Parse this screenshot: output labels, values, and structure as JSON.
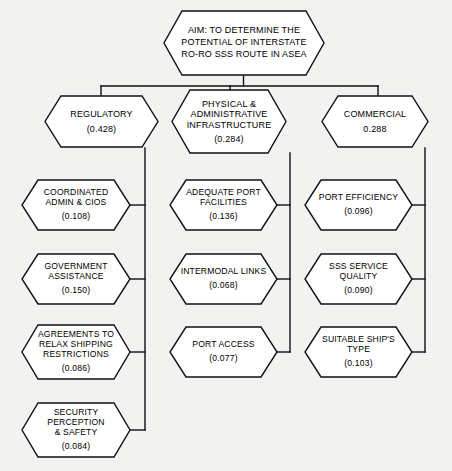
{
  "diagram": {
    "type": "hierarchy-tree",
    "orientation": "top-down",
    "node_shape": "hexagon",
    "colors": {
      "background": "#f2f2f0",
      "node_fill": "#ffffff",
      "stroke": "#111111",
      "text": "#000000"
    },
    "root": {
      "id": "aim",
      "label": "AIM: TO DETERMINE THE\nPOTENTIAL OF INTERSTATE\nRO-RO SSS ROUTE IN ASEA",
      "value": ""
    },
    "levels": [
      {
        "level": 1,
        "name": "criteria",
        "nodes": [
          {
            "id": "regulatory",
            "label": "REGULATORY",
            "value": "(0.428)"
          },
          {
            "id": "physical-admin-infra",
            "label": "PHYSICAL &\nADMINISTRATIVE\nINFRASTRUCTURE",
            "value": "(0.284)"
          },
          {
            "id": "commercial",
            "label": "COMMERCIAL",
            "value": "0.288"
          }
        ]
      },
      {
        "level": 2,
        "name": "sub-criteria",
        "columns": [
          {
            "parent": "regulatory",
            "nodes": [
              {
                "id": "coordinated-admin-cios",
                "label": "COORDINATED\nADMIN & CIOS",
                "value": "(0.108)"
              },
              {
                "id": "government-assistance",
                "label": "GOVERNMENT\nASSISTANCE",
                "value": "(0.150)"
              },
              {
                "id": "agreements-relax-shipping",
                "label": "AGREEMENTS TO\nRELAX SHIPPING\nRESTRICTIONS",
                "value": "(0.086)"
              },
              {
                "id": "security-perception-safety",
                "label": "SECURITY\nPERCEPTION\n& SAFETY",
                "value": "(0.084)"
              }
            ]
          },
          {
            "parent": "physical-admin-infra",
            "nodes": [
              {
                "id": "adequate-port-facilities",
                "label": "ADEQUATE PORT\nFACILITIES",
                "value": "(0.136)"
              },
              {
                "id": "intermodal-links",
                "label": "INTERMODAL LINKS",
                "value": "(0.068)"
              },
              {
                "id": "port-access",
                "label": "PORT ACCESS",
                "value": "(0.077)"
              }
            ]
          },
          {
            "parent": "commercial",
            "nodes": [
              {
                "id": "port-efficiency",
                "label": "PORT EFFICIENCY",
                "value": "(0.096)"
              },
              {
                "id": "sss-service-quality",
                "label": "SSS SERVICE\nQUALITY",
                "value": "(0.090)"
              },
              {
                "id": "suitable-ships-type",
                "label": "SUITABLE SHIP'S\nTYPE",
                "value": "(0.103)"
              }
            ]
          }
        ]
      }
    ]
  }
}
